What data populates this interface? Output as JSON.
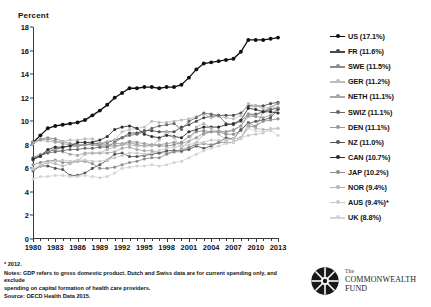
{
  "chart_data": {
    "type": "line",
    "title": "",
    "ylabel": "Percent",
    "xlabel": "",
    "ylim": [
      0,
      18
    ],
    "yticks": [
      0,
      2,
      4,
      6,
      8,
      10,
      12,
      14,
      16,
      18
    ],
    "xlim": [
      1980,
      2013
    ],
    "xticks": [
      1980,
      1983,
      1986,
      1989,
      1992,
      1995,
      1998,
      2001,
      2004,
      2007,
      2010,
      2013
    ],
    "x": [
      1980,
      1981,
      1982,
      1983,
      1984,
      1985,
      1986,
      1987,
      1988,
      1989,
      1990,
      1991,
      1992,
      1993,
      1994,
      1995,
      1996,
      1997,
      1998,
      1999,
      2000,
      2001,
      2002,
      2003,
      2004,
      2005,
      2006,
      2007,
      2008,
      2009,
      2010,
      2011,
      2012,
      2013
    ],
    "grid": false,
    "legend_position": "right",
    "series": [
      {
        "name": "US",
        "label": "US (17.1%)",
        "color": "#111111",
        "final_value": 17.1,
        "values": [
          8.2,
          8.8,
          9.4,
          9.6,
          9.7,
          9.8,
          9.9,
          10.1,
          10.5,
          10.9,
          11.4,
          12.0,
          12.4,
          12.8,
          12.8,
          12.9,
          12.9,
          12.8,
          12.9,
          12.9,
          13.1,
          13.7,
          14.4,
          14.9,
          15.0,
          15.1,
          15.2,
          15.3,
          15.9,
          16.9,
          16.9,
          16.9,
          17.0,
          17.1
        ]
      },
      {
        "name": "FR",
        "label": "FR (11.6%)",
        "color": "#4a4a4a",
        "final_value": 11.6,
        "values": [
          6.7,
          7.1,
          7.4,
          7.6,
          7.8,
          7.9,
          7.9,
          8.0,
          8.1,
          8.1,
          8.2,
          8.4,
          8.6,
          9.0,
          9.0,
          9.2,
          9.2,
          9.1,
          9.1,
          9.1,
          9.5,
          9.7,
          10.0,
          10.3,
          10.4,
          10.5,
          10.5,
          10.5,
          10.7,
          11.3,
          11.3,
          11.3,
          11.5,
          11.6
        ]
      },
      {
        "name": "SWE",
        "label": "SWE (11.5%)",
        "color": "#8c8c8c",
        "final_value": 11.5,
        "values": [
          8.2,
          8.5,
          8.6,
          8.5,
          8.3,
          8.1,
          8.0,
          8.0,
          8.0,
          7.9,
          7.9,
          7.9,
          8.0,
          8.2,
          8.0,
          7.9,
          8.0,
          7.9,
          7.9,
          8.0,
          8.2,
          8.7,
          9.1,
          9.2,
          9.1,
          9.1,
          8.9,
          8.9,
          9.2,
          9.9,
          9.5,
          10.8,
          11.2,
          11.5
        ]
      },
      {
        "name": "GER",
        "label": "GER (11.2%)",
        "color": "#bdbdbd",
        "final_value": 11.2,
        "values": [
          8.1,
          8.4,
          8.3,
          8.2,
          8.3,
          8.4,
          8.4,
          8.5,
          8.5,
          8.1,
          8.3,
          8.4,
          9.1,
          9.3,
          9.4,
          9.5,
          10.0,
          9.9,
          9.9,
          10.0,
          10.1,
          10.2,
          10.4,
          10.6,
          10.3,
          10.4,
          10.3,
          10.2,
          10.5,
          11.5,
          11.3,
          11.1,
          11.2,
          11.2
        ]
      },
      {
        "name": "NETH",
        "label": "NETH (11.1%)",
        "color": "#a8a8a8",
        "final_value": 11.1,
        "values": [
          6.9,
          7.2,
          7.5,
          7.6,
          7.4,
          7.2,
          7.1,
          7.3,
          7.3,
          7.3,
          7.3,
          7.4,
          7.7,
          7.8,
          7.6,
          7.5,
          7.5,
          7.3,
          7.3,
          7.4,
          7.4,
          7.7,
          8.2,
          8.9,
          9.1,
          9.2,
          9.1,
          9.3,
          9.6,
          10.4,
          10.4,
          10.9,
          11.0,
          11.1
        ]
      },
      {
        "name": "SWIZ",
        "label": "SWIZ (11.1%)",
        "color": "#6b6b6b",
        "final_value": 11.1,
        "values": [
          6.9,
          7.1,
          7.3,
          7.4,
          7.5,
          7.6,
          7.6,
          7.7,
          7.7,
          7.8,
          7.8,
          8.2,
          8.6,
          8.8,
          8.9,
          9.1,
          9.4,
          9.6,
          9.7,
          9.8,
          9.3,
          10.0,
          10.3,
          10.7,
          10.6,
          10.5,
          9.8,
          9.7,
          10.0,
          10.6,
          10.6,
          10.8,
          11.0,
          11.1
        ]
      },
      {
        "name": "DEN",
        "label": "DEN (11.1%)",
        "color": "#9a9a9a",
        "final_value": 11.1,
        "values": [
          8.2,
          8.4,
          8.5,
          8.3,
          8.1,
          8.0,
          7.9,
          8.0,
          8.1,
          8.0,
          8.0,
          8.1,
          8.1,
          8.3,
          8.2,
          8.1,
          8.0,
          8.0,
          8.1,
          8.2,
          8.1,
          8.3,
          8.6,
          9.0,
          9.1,
          9.1,
          9.1,
          9.2,
          9.6,
          10.6,
          10.4,
          10.3,
          10.5,
          11.1
        ]
      },
      {
        "name": "NZ",
        "label": "NZ (11.0%)",
        "color": "#575757",
        "final_value": 11.0,
        "values": [
          5.8,
          6.2,
          6.2,
          6.0,
          5.9,
          5.4,
          5.4,
          5.6,
          6.0,
          6.3,
          6.7,
          7.2,
          7.3,
          7.0,
          7.0,
          7.1,
          7.2,
          7.3,
          7.5,
          7.5,
          7.5,
          7.6,
          7.9,
          7.7,
          7.9,
          8.2,
          8.6,
          8.5,
          9.3,
          9.8,
          10.0,
          10.1,
          10.3,
          11.0
        ]
      },
      {
        "name": "CAN",
        "label": "CAN (10.7%)",
        "color": "#2e2e2e",
        "final_value": 10.7,
        "values": [
          6.8,
          7.0,
          7.6,
          7.8,
          7.8,
          7.9,
          8.2,
          8.2,
          8.2,
          8.4,
          8.7,
          9.3,
          9.5,
          9.6,
          9.4,
          8.9,
          8.7,
          8.6,
          8.8,
          8.7,
          8.6,
          9.1,
          9.3,
          9.5,
          9.5,
          9.5,
          9.7,
          9.8,
          10.1,
          11.1,
          11.0,
          10.8,
          10.8,
          10.7
        ]
      },
      {
        "name": "JAP",
        "label": "JAP (10.2%)",
        "color": "#8f8f8f",
        "final_value": 10.2,
        "values": [
          6.3,
          6.5,
          6.6,
          6.7,
          6.5,
          6.5,
          6.6,
          6.6,
          6.4,
          6.0,
          6.0,
          6.1,
          6.3,
          6.5,
          6.6,
          6.8,
          6.9,
          6.9,
          7.2,
          7.4,
          7.6,
          7.8,
          8.0,
          8.1,
          8.0,
          8.2,
          8.2,
          8.2,
          8.6,
          9.5,
          9.6,
          10.0,
          10.1,
          10.2
        ]
      },
      {
        "name": "NOR",
        "label": "NOR (9.4%)",
        "color": "#b5b5b5",
        "final_value": 9.4,
        "values": [
          5.9,
          6.2,
          6.5,
          6.4,
          6.2,
          6.4,
          6.6,
          7.2,
          7.3,
          7.3,
          7.6,
          7.8,
          8.0,
          8.0,
          7.9,
          7.9,
          7.9,
          8.4,
          9.1,
          8.6,
          7.7,
          8.3,
          9.5,
          9.8,
          9.4,
          8.9,
          8.4,
          8.5,
          8.6,
          9.7,
          9.4,
          9.3,
          9.3,
          9.4
        ]
      },
      {
        "name": "AUS",
        "label": "AUS (9.4%)*",
        "color": "#c9c9c9",
        "final_value": 9.4,
        "values": [
          6.0,
          6.3,
          6.5,
          6.6,
          6.7,
          6.6,
          6.7,
          6.7,
          6.6,
          6.6,
          6.7,
          6.9,
          7.1,
          7.3,
          7.3,
          7.2,
          7.3,
          7.5,
          7.7,
          7.8,
          7.9,
          8.0,
          8.2,
          8.2,
          8.4,
          8.4,
          8.4,
          8.5,
          8.6,
          8.8,
          8.9,
          9.0,
          9.4,
          9.4
        ]
      },
      {
        "name": "UK",
        "label": "UK (8.8%)",
        "color": "#d4d4d4",
        "final_value": 8.8,
        "values": [
          5.1,
          5.3,
          5.3,
          5.4,
          5.4,
          5.3,
          5.3,
          5.4,
          5.3,
          5.2,
          5.3,
          5.6,
          6.0,
          6.1,
          6.2,
          6.2,
          6.3,
          6.2,
          6.3,
          6.5,
          6.6,
          6.9,
          7.2,
          7.5,
          7.7,
          7.9,
          8.1,
          8.2,
          8.5,
          9.4,
          9.2,
          9.1,
          9.2,
          8.8
        ]
      }
    ]
  },
  "footnotes": {
    "asterisk": "* 2012.",
    "notes_line1": "Notes: GDP refers to gross domestic product. Dutch and Swiss data are for current spending only, and exclude",
    "notes_line2": "spending on capital formation of health care providers.",
    "source": "Source: OECD Health Data 2015."
  },
  "logo": {
    "the": "The",
    "name_line1": "COMMONWEALTH",
    "name_line2": "FUND"
  }
}
